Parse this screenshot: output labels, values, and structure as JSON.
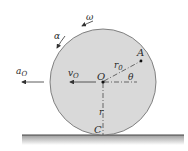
{
  "diagram": {
    "type": "rolling-disk-kinematics",
    "labels": {
      "omega": "ω",
      "alpha": "α",
      "a_O_main": "a",
      "a_O_sub": "O",
      "v_O_main": "v",
      "v_O_sub": "O",
      "center": "O",
      "point_A": "A",
      "r_0_main": "r",
      "r_0_sub": "0",
      "theta": "θ",
      "r": "r",
      "contact": "C"
    },
    "colors": {
      "disk_fill": "#d9d9d9",
      "disk_stroke": "#555555",
      "lines": "#333333",
      "ground": "#444444"
    }
  }
}
